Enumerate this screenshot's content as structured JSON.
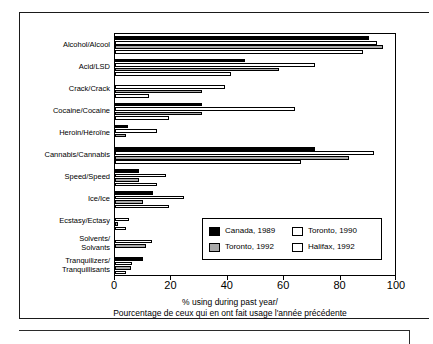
{
  "chart_data": {
    "type": "bar",
    "orientation": "horizontal",
    "title": "",
    "xlabel": "% using during past year/\nPourcentage de ceux qui en ont fait usage l'année précédente",
    "ylabel": "",
    "xlim": [
      0,
      100
    ],
    "xticks": [
      0,
      20,
      40,
      60,
      80,
      100
    ],
    "xtick_labels": [
      "0",
      "20",
      "40",
      "60",
      "80",
      "100"
    ],
    "grid": false,
    "legend_position": "inside-lower-right",
    "categories": [
      "Alcohol/Alcool",
      "Acid/LSD",
      "Crack/Crack",
      "Cocaine/Cocaine",
      "Heroin/Héroïne",
      "Cannabis/Cannabis",
      "Speed/Speed",
      "Ice/Ice",
      "Ecstasy/Ectasy",
      "Solvents/\nSolvants",
      "Tranquilizers/\nTranquillisants"
    ],
    "series": [
      {
        "name": "Canada, 1989",
        "key": "canada",
        "color": "#000000",
        "values": [
          90,
          46,
          0,
          31,
          4.5,
          71,
          8.5,
          13.5,
          0,
          0,
          10
        ]
      },
      {
        "name": "Toronto, 1990",
        "key": "tor90",
        "color": "#ffffff",
        "values": [
          93,
          71,
          39,
          64,
          15,
          92,
          18,
          24.5,
          5,
          13,
          6
        ]
      },
      {
        "name": "Toronto, 1992",
        "key": "tor92",
        "color": "#a9a9a9",
        "values": [
          95,
          58,
          31,
          31,
          4,
          83,
          8.5,
          10,
          1,
          11,
          5.5
        ]
      },
      {
        "name": "Halifax, 1992",
        "key": "halifax",
        "color": "#ffffff",
        "values": [
          88,
          41,
          12,
          19,
          0,
          66,
          15,
          19,
          4,
          0,
          4
        ]
      }
    ]
  },
  "legend": {
    "entries": [
      {
        "label": "Canada, 1989",
        "key": "canada"
      },
      {
        "label": "Toronto, 1990",
        "key": "tor90"
      },
      {
        "label": "Toronto, 1992",
        "key": "tor92"
      },
      {
        "label": "Halifax, 1992",
        "key": "halifax"
      }
    ]
  },
  "axis": {
    "x_title_line1": "% using during past year/",
    "x_title_line2": "Pourcentage de ceux qui en ont fait usage l'année précédente"
  },
  "colors": {
    "canada": "#000000",
    "toronto_1990": "#ffffff",
    "toronto_1992": "#a9a9a9",
    "halifax_1992": "#ffffff",
    "axis": "#000000",
    "frame": "#1a1a1a",
    "background": "#ffffff"
  }
}
